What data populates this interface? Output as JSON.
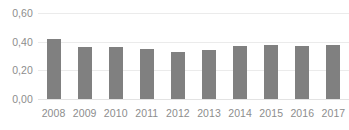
{
  "chart_data": {
    "type": "bar",
    "title": "",
    "subtitle": "",
    "xlabel": "",
    "ylabel": "",
    "categories": [
      "2008",
      "2009",
      "2010",
      "2011",
      "2012",
      "2013",
      "2014",
      "2015",
      "2016",
      "2017"
    ],
    "values": [
      0.42,
      0.36,
      0.36,
      0.35,
      0.33,
      0.34,
      0.37,
      0.38,
      0.37,
      0.38
    ],
    "series": [
      {
        "name": "",
        "values": [
          0.42,
          0.36,
          0.36,
          0.35,
          0.33,
          0.34,
          0.37,
          0.38,
          0.37,
          0.38
        ]
      }
    ],
    "ylim": [
      0.0,
      0.6
    ],
    "y_ticks": [
      0.0,
      0.2,
      0.4,
      0.6
    ],
    "y_tick_labels": [
      "0,00",
      "0,20",
      "0,40",
      "0,60"
    ],
    "decimal_separator": ",",
    "grid": true,
    "grid_axis": "y",
    "legend": false,
    "legend_position": "none",
    "annotations": [],
    "colors": {
      "bar": "#808080",
      "gridline": "#ebebeb",
      "baseline": "#e3e3e3",
      "tick_label": "#8d8d8d",
      "background": "#ffffff"
    }
  }
}
